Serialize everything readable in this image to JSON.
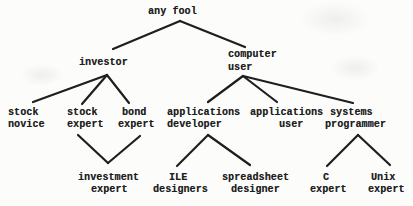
{
  "diagram": {
    "background": "#fcfcfb",
    "ink": "#1e1e1e",
    "stroke_width": 2.2,
    "nodes": [
      {
        "id": "any-fool",
        "label": "any fool",
        "lines": [
          {
            "text": "any fool",
            "x": 148,
            "y": 5.5
          }
        ]
      },
      {
        "id": "investor",
        "label": "investor",
        "lines": [
          {
            "text": "investor",
            "x": 79,
            "y": 56.5
          }
        ]
      },
      {
        "id": "computer-user",
        "label": "computer user",
        "lines": [
          {
            "text": "computer",
            "x": 228,
            "y": 49
          },
          {
            "text": "user",
            "x": 228,
            "y": 61.5
          }
        ]
      },
      {
        "id": "stock-novice",
        "label": "stock novice",
        "lines": [
          {
            "text": "stock",
            "x": 8,
            "y": 106.5
          },
          {
            "text": "novice",
            "x": 8,
            "y": 119
          }
        ]
      },
      {
        "id": "stock-expert",
        "label": "stock expert",
        "lines": [
          {
            "text": "stock",
            "x": 67,
            "y": 106.5
          },
          {
            "text": "expert",
            "x": 67,
            "y": 119
          }
        ]
      },
      {
        "id": "bond-expert",
        "label": "bond expert",
        "lines": [
          {
            "text": "bond",
            "x": 122,
            "y": 106.5
          },
          {
            "text": "expert",
            "x": 118,
            "y": 119
          }
        ]
      },
      {
        "id": "applications-developer",
        "label": "applications developer",
        "lines": [
          {
            "text": "applications",
            "x": 167,
            "y": 106.5
          },
          {
            "text": "developer",
            "x": 167,
            "y": 119
          }
        ]
      },
      {
        "id": "applications-user",
        "label": "applications user",
        "lines": [
          {
            "text": "applications",
            "x": 250,
            "y": 106.5
          },
          {
            "text": "user",
            "x": 279,
            "y": 119
          }
        ]
      },
      {
        "id": "systems-programmer",
        "label": "systems programmer",
        "lines": [
          {
            "text": "systems",
            "x": 330,
            "y": 106.5
          },
          {
            "text": "programmer",
            "x": 325,
            "y": 119
          }
        ]
      },
      {
        "id": "investment-expert",
        "label": "investment expert",
        "lines": [
          {
            "text": "investment",
            "x": 78,
            "y": 172
          },
          {
            "text": "expert",
            "x": 91,
            "y": 184
          }
        ]
      },
      {
        "id": "ile-designers",
        "label": "ILE designers",
        "lines": [
          {
            "text": "ILE",
            "x": 169,
            "y": 172
          },
          {
            "text": "designers",
            "x": 153,
            "y": 184
          }
        ]
      },
      {
        "id": "spreadsheet-designer",
        "label": "spreadsheet designer",
        "lines": [
          {
            "text": "spreadsheet",
            "x": 222,
            "y": 172
          },
          {
            "text": "designer",
            "x": 231,
            "y": 184
          }
        ]
      },
      {
        "id": "c-expert",
        "label": "C expert",
        "lines": [
          {
            "text": "C",
            "x": 323,
            "y": 172
          },
          {
            "text": "expert",
            "x": 310,
            "y": 184
          }
        ]
      },
      {
        "id": "unix-expert",
        "label": "Unix expert",
        "lines": [
          {
            "text": "Unix",
            "x": 371,
            "y": 172
          },
          {
            "text": "expert",
            "x": 368,
            "y": 184
          }
        ]
      }
    ],
    "edges": [
      {
        "from": "any-fool",
        "to": "investor",
        "x1": 180,
        "y1": 21,
        "x2": 113,
        "y2": 49
      },
      {
        "from": "any-fool",
        "to": "computer-user",
        "x1": 180,
        "y1": 21,
        "x2": 245,
        "y2": 47
      },
      {
        "from": "investor",
        "to": "stock-novice",
        "x1": 107,
        "y1": 75,
        "x2": 33,
        "y2": 102
      },
      {
        "from": "investor",
        "to": "stock-expert",
        "x1": 107,
        "y1": 75,
        "x2": 82,
        "y2": 104
      },
      {
        "from": "investor",
        "to": "bond-expert",
        "x1": 107,
        "y1": 75,
        "x2": 129,
        "y2": 103
      },
      {
        "from": "computer-user",
        "to": "applications-developer",
        "x1": 243,
        "y1": 76,
        "x2": 208,
        "y2": 102
      },
      {
        "from": "computer-user",
        "to": "applications-user",
        "x1": 243,
        "y1": 76,
        "x2": 277,
        "y2": 102
      },
      {
        "from": "computer-user",
        "to": "systems-programmer",
        "x1": 243,
        "y1": 76,
        "x2": 353,
        "y2": 103
      },
      {
        "from": "stock-expert",
        "to": "investment-expert",
        "x1": 78,
        "y1": 135,
        "x2": 108,
        "y2": 163
      },
      {
        "from": "bond-expert",
        "to": "investment-expert",
        "x1": 140,
        "y1": 136,
        "x2": 108,
        "y2": 163
      },
      {
        "from": "applications-developer",
        "to": "ile-designers",
        "x1": 208,
        "y1": 135,
        "x2": 177,
        "y2": 166
      },
      {
        "from": "applications-developer",
        "to": "spreadsheet-designer",
        "x1": 208,
        "y1": 135,
        "x2": 250,
        "y2": 165
      },
      {
        "from": "systems-programmer",
        "to": "c-expert",
        "x1": 358,
        "y1": 135,
        "x2": 327,
        "y2": 166
      },
      {
        "from": "systems-programmer",
        "to": "unix-expert",
        "x1": 358,
        "y1": 135,
        "x2": 390,
        "y2": 165
      }
    ],
    "hierarchy": [
      {
        "parent": "any fool",
        "children": [
          "investor",
          "computer user"
        ]
      },
      {
        "parent": "investor",
        "children": [
          "stock novice",
          "stock expert",
          "bond expert"
        ]
      },
      {
        "parent": "computer user",
        "children": [
          "applications developer",
          "applications user",
          "systems programmer"
        ]
      },
      {
        "parents": [
          "stock expert",
          "bond expert"
        ],
        "children": [
          "investment expert"
        ]
      },
      {
        "parent": "applications developer",
        "children": [
          "ILE designers",
          "spreadsheet designer"
        ]
      },
      {
        "parent": "systems programmer",
        "children": [
          "C expert",
          "Unix expert"
        ]
      }
    ]
  }
}
